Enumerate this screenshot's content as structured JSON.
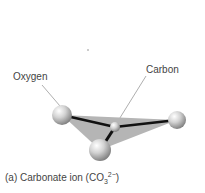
{
  "labels": {
    "oxygen": "Oxygen",
    "carbon": "Carbon"
  },
  "caption": {
    "prefix": "(a) Carbonate ion (CO",
    "subscript": "3",
    "superscript": "2−",
    "suffix": ")"
  },
  "colors": {
    "plane": "#b5b5b5",
    "bond": "#111111",
    "sphere": "#cfcfcf",
    "leader": "#777777",
    "text": "#444444"
  }
}
